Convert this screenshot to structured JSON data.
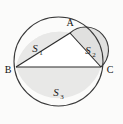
{
  "figure": {
    "background_color": "#fbfbfa",
    "fill_color": "#e8e8e7",
    "fill_color_dark": "#dedede",
    "stroke_color": "#3a3a3a",
    "triangle_fill": "#ffffff",
    "vertices": [
      {
        "name": "A",
        "label": "A",
        "x": 70,
        "y": 33
      },
      {
        "name": "B",
        "label": "B",
        "x": 16,
        "y": 67
      },
      {
        "name": "C",
        "label": "C",
        "x": 101,
        "y": 67
      }
    ],
    "vertex_label_positions": [
      {
        "label": "A",
        "x": 70,
        "y": 24
      },
      {
        "label": "B",
        "x": 9,
        "y": 73
      },
      {
        "label": "C",
        "x": 107,
        "y": 73
      }
    ],
    "regions": [
      {
        "name": "region-s1",
        "symbol": "S",
        "subscript": "1",
        "label": "S1",
        "label_x": 38,
        "label_y": 48,
        "description": "Upper-left region of the large circle cut off by chords BA and BC"
      },
      {
        "name": "region-s2",
        "symbol": "S",
        "subscript": "2",
        "label": "S2",
        "label_x": 91,
        "label_y": 50,
        "description": "Semicircle on side AC"
      },
      {
        "name": "region-s3",
        "symbol": "S",
        "subscript": "3",
        "label": "S3",
        "label_x": 59,
        "label_y": 92,
        "description": "Lower half of the large circle below chord BC"
      }
    ],
    "large_circle": {
      "cx": 58.5,
      "cy": 61.5,
      "r": 44.5
    },
    "semicircle_ac": {
      "cx": 85.5,
      "cy": 50,
      "r": 22.6
    },
    "chord_bc": {
      "x1": 16,
      "y1": 67,
      "x2": 101,
      "y2": 67
    },
    "chord_ba": {
      "x1": 16,
      "y1": 67,
      "x2": 70,
      "y2": 33
    },
    "chord_ac": {
      "x1": 70,
      "y1": 33,
      "x2": 101,
      "y2": 67
    }
  }
}
